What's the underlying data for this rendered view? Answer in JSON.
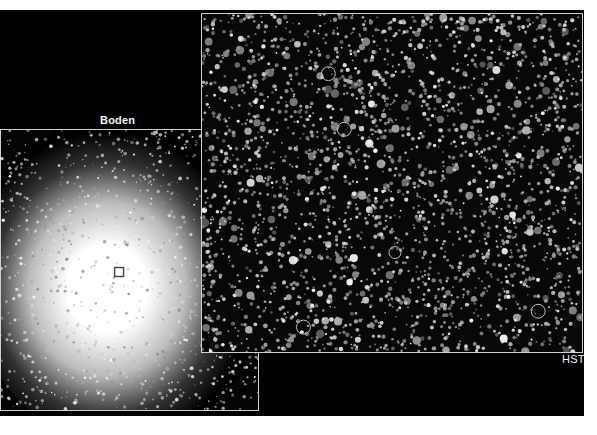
{
  "figure": {
    "panels": [
      {
        "id": "boden",
        "label": "Boden",
        "description": "Ground-based image of a dense globular star cluster with bright saturated core",
        "marker": {
          "shape": "square",
          "x": 119,
          "y": 272,
          "size": 9
        }
      },
      {
        "id": "hst",
        "label": "HST",
        "description": "Hubble Space Telescope image of the cluster core region resolving individual stars",
        "circles": [
          {
            "x": 328,
            "y": 73,
            "r": 7
          },
          {
            "x": 344,
            "y": 129,
            "r": 7
          },
          {
            "x": 395,
            "y": 253,
            "r": 6
          },
          {
            "x": 303,
            "y": 328,
            "r": 7
          },
          {
            "x": 539,
            "y": 312,
            "r": 7
          }
        ]
      }
    ],
    "colors": {
      "background": "#000000",
      "frame": "#cfcfcf",
      "label": "#f2f2f2",
      "page": "#ffffff"
    }
  }
}
